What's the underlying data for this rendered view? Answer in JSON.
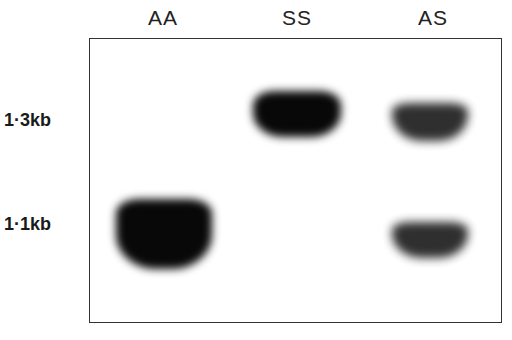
{
  "lanes": [
    {
      "label": "AA"
    },
    {
      "label": "SS"
    },
    {
      "label": "AS"
    }
  ],
  "size_markers": [
    {
      "label": "1·3kb"
    },
    {
      "label": "1·1kb"
    }
  ],
  "bands": [
    {
      "lane": "AA",
      "size": "1·1kb",
      "intensity": "strong"
    },
    {
      "lane": "SS",
      "size": "1·3kb",
      "intensity": "strong"
    },
    {
      "lane": "AS",
      "size": "1·3kb",
      "intensity": "moderate"
    },
    {
      "lane": "AS",
      "size": "1·1kb",
      "intensity": "moderate"
    }
  ],
  "colors": {
    "band": "#080808",
    "frame": "#333333",
    "background": "#ffffff"
  }
}
